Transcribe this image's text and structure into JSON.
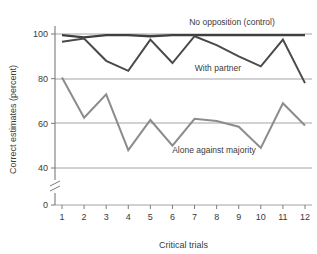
{
  "chart_data": {
    "type": "line",
    "title": "",
    "xlabel": "Critical trials",
    "ylabel": "Correct estimates (percent)",
    "x": [
      1,
      2,
      3,
      4,
      5,
      6,
      7,
      8,
      9,
      10,
      11,
      12
    ],
    "xtick_labels": [
      "1",
      "2",
      "3",
      "4",
      "5",
      "6",
      "7",
      "8",
      "9",
      "10",
      "11",
      "12"
    ],
    "ytick_labels": [
      "0",
      "40",
      "60",
      "80",
      "100"
    ],
    "ytick_values": [
      0,
      40,
      60,
      80,
      100
    ],
    "ylim": [
      0,
      104
    ],
    "xlim": [
      0.6,
      12.4
    ],
    "axis_break": true,
    "axis_break_between": [
      0,
      40
    ],
    "grid": "horizontal",
    "legend_position": "inline-annotations",
    "series": [
      {
        "name": "No opposition (control)",
        "label": "No opposition (control)",
        "color": "#3f3f3f",
        "width": 2.4,
        "values": [
          99.5,
          98.5,
          99.5,
          99.5,
          99.0,
          99.5,
          99.5,
          99.5,
          99.5,
          99.5,
          99.5,
          99.5
        ]
      },
      {
        "name": "With partner",
        "label": "With partner",
        "color": "#4a4a4a",
        "width": 2.0,
        "values": [
          96.5,
          98.0,
          88.0,
          83.5,
          97.5,
          87.0,
          99.0,
          95.0,
          90.0,
          85.5,
          97.5,
          78.0
        ]
      },
      {
        "name": "Alone against majority",
        "label": "Alone against majority",
        "color": "#8c8c8c",
        "width": 2.0,
        "values": [
          80.5,
          62.5,
          73.0,
          48.0,
          61.5,
          50.0,
          62.0,
          61.0,
          58.5,
          49.0,
          69.0,
          59.0
        ]
      }
    ],
    "annotations": [
      {
        "text": "No opposition (control)",
        "x_px": 232,
        "y_px": 25
      },
      {
        "text": "With partner",
        "x_px": 218,
        "y_px": 71
      },
      {
        "text": "Alone against majority",
        "x_px": 214,
        "y_px": 153
      }
    ]
  }
}
